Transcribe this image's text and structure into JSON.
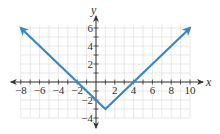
{
  "chart_data": {
    "type": "line",
    "title": "",
    "xlabel": "x",
    "ylabel": "y",
    "function": "y = |x - 1| - 3",
    "xlim": [
      -8,
      10
    ],
    "ylim": [
      -4,
      6
    ],
    "grid": true,
    "x_ticks": [
      -8,
      -6,
      -4,
      -2,
      2,
      4,
      6,
      8,
      10
    ],
    "y_ticks": [
      -4,
      -2,
      2,
      4,
      6
    ],
    "x_tick_labels": [
      "−8",
      "−6",
      "−4",
      "−2",
      "2",
      "4",
      "6",
      "8",
      "10"
    ],
    "y_tick_labels": [
      "−4",
      "−2",
      "2",
      "4",
      "6"
    ],
    "series": [
      {
        "name": "y = |x - 1| - 3",
        "color": "#3a87c8",
        "points": [
          [
            -8,
            6
          ],
          [
            1,
            -3
          ],
          [
            10,
            6
          ]
        ],
        "arrows": [
          "start",
          "end"
        ]
      }
    ],
    "key_points": {
      "vertex": [
        1,
        -3
      ],
      "x_intercepts": [
        -2,
        4
      ],
      "y_intercept": [
        0,
        -2
      ]
    }
  },
  "colors": {
    "curve": "#3a87c8",
    "axis": "#333333",
    "grid": "#d8d8d8"
  }
}
